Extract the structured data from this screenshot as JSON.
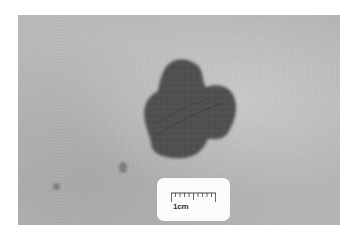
{
  "image": {
    "subject": "pigmented skin lesion with irregular lobulated border, grayscale clinical photograph",
    "colors": {
      "background": "#ffffff",
      "skin": "#b6b6b6",
      "lesion": "#4e4e4e",
      "scale_card": "#fbfbfb"
    }
  },
  "scale_card": {
    "label": "1cm"
  }
}
